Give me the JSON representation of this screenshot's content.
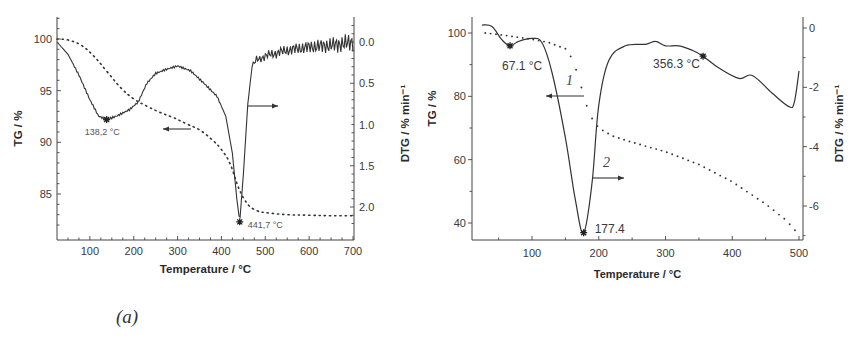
{
  "figure": {
    "captions": {
      "a": "(a)",
      "b": "(b)"
    }
  },
  "chart_data": [
    {
      "id": "a",
      "type": "line",
      "title": "",
      "xlabel": "Temperature / °C",
      "ylabel": "TG / %",
      "y2label": "DTG / % min⁻¹",
      "xlim": [
        25,
        705
      ],
      "ylim": [
        81,
        102
      ],
      "y2lim_inverted": [
        -0.2,
        2.3
      ],
      "xticks": [
        100,
        200,
        300,
        400,
        500,
        600,
        700
      ],
      "yticks": [
        85,
        90,
        95,
        100
      ],
      "y2ticks": [
        "0.0",
        "0.5",
        "1.0",
        "1.5",
        "2.0"
      ],
      "grid": false,
      "series": [
        {
          "name": "TG",
          "style": "dotted",
          "axis": "left",
          "x": [
            25,
            50,
            80,
            110,
            140,
            170,
            200,
            230,
            260,
            290,
            320,
            350,
            380,
            400,
            420,
            440,
            460,
            480,
            500,
            550,
            600,
            650,
            700
          ],
          "values": [
            100,
            99.9,
            99.4,
            98.3,
            96.8,
            95.3,
            94.2,
            93.5,
            92.9,
            92.4,
            91.8,
            91.2,
            90.2,
            89.3,
            87.9,
            85.5,
            84.0,
            83.4,
            83.2,
            83.0,
            82.95,
            82.9,
            82.9
          ]
        },
        {
          "name": "DTG",
          "style": "solid",
          "axis": "right",
          "x": [
            25,
            50,
            75,
            100,
            120,
            138.2,
            160,
            190,
            210,
            230,
            250,
            275,
            300,
            330,
            360,
            390,
            410,
            425,
            435,
            441.7,
            450,
            460,
            470,
            480,
            500,
            550,
            600,
            650,
            680,
            700
          ],
          "values": [
            0.0,
            0.15,
            0.4,
            0.7,
            0.9,
            0.94,
            0.9,
            0.82,
            0.73,
            0.5,
            0.38,
            0.33,
            0.29,
            0.35,
            0.5,
            0.66,
            0.9,
            1.35,
            1.9,
            2.18,
            1.6,
            0.75,
            0.3,
            0.22,
            0.17,
            0.1,
            0.06,
            0.04,
            0.02,
            0.0
          ]
        }
      ],
      "annotations": [
        {
          "text": "138,2 °C",
          "x": 138.2,
          "series": "DTG"
        },
        {
          "text": "441,7 °C",
          "x": 441.7,
          "series": "DTG"
        }
      ],
      "arrows": [
        {
          "points_to": "left",
          "series": "TG",
          "near_x": 300
        },
        {
          "points_to": "right",
          "series": "DTG",
          "near_x": 500
        }
      ]
    },
    {
      "id": "b",
      "type": "line",
      "title": "",
      "xlabel": "Temperature / °C",
      "ylabel": "TG / %",
      "y2label": "DTG / % min⁻¹",
      "xlim": [
        12,
        505
      ],
      "ylim": [
        32,
        105
      ],
      "y2lim": [
        -7.3,
        0.5
      ],
      "xticks": [
        100,
        200,
        300,
        400,
        500
      ],
      "yticks": [
        40,
        60,
        80,
        100
      ],
      "y2ticks": [
        0,
        -2,
        -4,
        -6
      ],
      "grid": false,
      "series": [
        {
          "name": "1 (TG)",
          "style": "dotted",
          "axis": "left",
          "x": [
            30,
            50,
            75,
            100,
            125,
            150,
            160,
            170,
            180,
            190,
            200,
            220,
            250,
            300,
            350,
            400,
            450,
            480,
            495
          ],
          "values": [
            100,
            99.5,
            98.8,
            98.0,
            97.0,
            95.0,
            92.0,
            86.0,
            78.0,
            73.0,
            70.0,
            67.5,
            65.5,
            62.5,
            58.5,
            53.0,
            46.0,
            41.0,
            37.5
          ]
        },
        {
          "name": "2 (DTG)",
          "style": "solid",
          "axis": "right",
          "x": [
            25,
            40,
            55,
            67.1,
            80,
            100,
            115,
            130,
            150,
            165,
            177.4,
            190,
            200,
            215,
            240,
            270,
            285,
            300,
            320,
            340,
            356.3,
            380,
            410,
            430,
            460,
            485,
            493,
            500
          ],
          "values": [
            0.1,
            0.05,
            -0.4,
            -0.6,
            -0.45,
            -0.35,
            -0.5,
            -1.5,
            -3.7,
            -5.8,
            -6.9,
            -5.2,
            -2.6,
            -1.1,
            -0.6,
            -0.55,
            -0.45,
            -0.6,
            -0.6,
            -0.75,
            -0.95,
            -1.35,
            -1.7,
            -1.6,
            -2.2,
            -2.65,
            -2.5,
            -1.45
          ]
        }
      ],
      "annotations": [
        {
          "text": "67.1 °C",
          "x": 67.1,
          "series": "DTG"
        },
        {
          "text": "177.4",
          "x": 177.4,
          "series": "DTG"
        },
        {
          "text": "356.3 °C",
          "x": 356.3,
          "series": "DTG"
        }
      ],
      "curve_labels": [
        {
          "text": "1",
          "series": "TG"
        },
        {
          "text": "2",
          "series": "DTG"
        }
      ],
      "arrows": [
        {
          "points_to": "left",
          "series": "TG",
          "near_x": 150
        },
        {
          "points_to": "right",
          "series": "DTG",
          "near_x": 210
        }
      ]
    }
  ]
}
